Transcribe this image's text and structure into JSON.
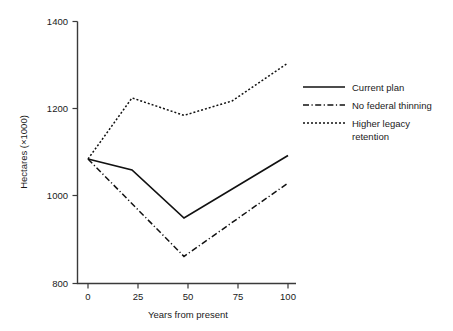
{
  "chart_data": {
    "type": "line",
    "title": "",
    "xlabel": "Years from present",
    "ylabel": "Hectares (×1000)",
    "xlim": [
      0,
      100
    ],
    "ylim": [
      800,
      1400
    ],
    "xticks": [
      0,
      25,
      50,
      75,
      100
    ],
    "yticks": [
      800,
      1000,
      1200,
      1400
    ],
    "xtick_labels": [
      "0",
      "25",
      "50",
      "75",
      "100"
    ],
    "ytick_labels": [
      "800",
      "1000",
      "1200",
      "1400"
    ],
    "grid": false,
    "legend_position": "right",
    "series": [
      {
        "name": "Current plan",
        "style": "solid",
        "color": "#111111",
        "x": [
          0,
          22,
          48,
          100
        ],
        "values": [
          1085,
          1060,
          950,
          1093
        ]
      },
      {
        "name": "No federal thinning",
        "style": "dash-dot",
        "color": "#111111",
        "x": [
          0,
          48,
          100
        ],
        "values": [
          1085,
          862,
          1030
        ]
      },
      {
        "name": "Higher legacy retention",
        "style": "dotted",
        "color": "#111111",
        "x": [
          0,
          22,
          48,
          72,
          100
        ],
        "values": [
          1085,
          1225,
          1185,
          1218,
          1305
        ]
      }
    ]
  },
  "axes": {
    "y_axis_title": "Hectares (×1000)",
    "x_axis_title": "Years from present",
    "y_ticks": [
      {
        "label": "1400",
        "value": 1400
      },
      {
        "label": "1200",
        "value": 1200
      },
      {
        "label": "1000",
        "value": 1000
      },
      {
        "label": "800",
        "value": 800
      }
    ],
    "x_ticks": [
      {
        "label": "0",
        "value": 0
      },
      {
        "label": "25",
        "value": 25
      },
      {
        "label": "50",
        "value": 50
      },
      {
        "label": "75",
        "value": 75
      },
      {
        "label": "100",
        "value": 100
      }
    ]
  },
  "legend": {
    "entries": [
      {
        "label": "Current plan",
        "style": "solid"
      },
      {
        "label": "No federal thinning",
        "style": "dash-dot"
      },
      {
        "label": "Higher legacy",
        "label2": "retention",
        "style": "dotted"
      }
    ]
  }
}
